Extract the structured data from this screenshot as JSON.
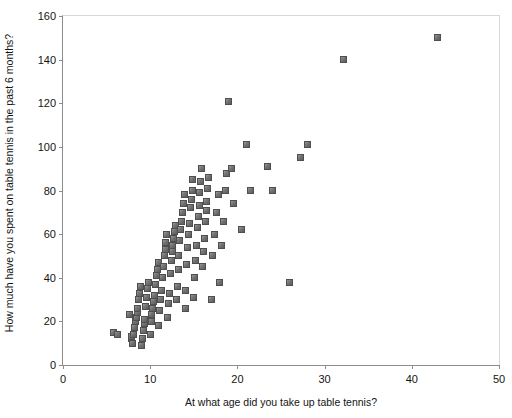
{
  "chart_data": {
    "type": "scatter",
    "title": "",
    "xlabel": "At what age did you take up table tennis?",
    "ylabel": "How much have you spent on table tennis in the past 6 months?",
    "xlim": [
      0,
      50
    ],
    "ylim": [
      0,
      160
    ],
    "xticks": [
      0,
      10,
      20,
      30,
      40,
      50
    ],
    "yticks": [
      0,
      20,
      40,
      60,
      80,
      100,
      120,
      140,
      160
    ],
    "grid": false,
    "legend": null,
    "marker": "square",
    "marker_color": "#6e6e6e",
    "axis_color": "#8c8c8c",
    "background_color": "#ffffff",
    "points": [
      [
        5.8,
        15
      ],
      [
        6.2,
        14
      ],
      [
        7.6,
        23
      ],
      [
        7.8,
        12
      ],
      [
        7.9,
        13
      ],
      [
        8.0,
        10
      ],
      [
        8.1,
        14
      ],
      [
        8.2,
        17
      ],
      [
        8.3,
        20
      ],
      [
        8.4,
        22
      ],
      [
        8.5,
        24
      ],
      [
        8.6,
        26
      ],
      [
        8.7,
        30
      ],
      [
        8.8,
        33
      ],
      [
        8.9,
        36
      ],
      [
        9.0,
        9
      ],
      [
        9.1,
        12
      ],
      [
        9.2,
        16
      ],
      [
        9.3,
        19
      ],
      [
        9.4,
        21
      ],
      [
        9.5,
        27
      ],
      [
        9.6,
        31
      ],
      [
        9.7,
        35
      ],
      [
        9.8,
        38
      ],
      [
        10.0,
        14
      ],
      [
        10.1,
        20
      ],
      [
        10.2,
        23
      ],
      [
        10.3,
        26
      ],
      [
        10.4,
        29
      ],
      [
        10.5,
        32
      ],
      [
        10.6,
        37
      ],
      [
        10.7,
        41
      ],
      [
        10.8,
        44
      ],
      [
        10.9,
        47
      ],
      [
        11.0,
        18
      ],
      [
        11.1,
        25
      ],
      [
        11.2,
        30
      ],
      [
        11.3,
        34
      ],
      [
        11.4,
        40
      ],
      [
        11.5,
        45
      ],
      [
        11.6,
        50
      ],
      [
        11.7,
        53
      ],
      [
        11.8,
        56
      ],
      [
        11.9,
        60
      ],
      [
        12.0,
        22
      ],
      [
        12.1,
        28
      ],
      [
        12.2,
        33
      ],
      [
        12.3,
        42
      ],
      [
        12.4,
        48
      ],
      [
        12.5,
        52
      ],
      [
        12.6,
        55
      ],
      [
        12.7,
        58
      ],
      [
        12.8,
        61
      ],
      [
        12.9,
        64
      ],
      [
        13.0,
        30
      ],
      [
        13.1,
        36
      ],
      [
        13.2,
        44
      ],
      [
        13.3,
        50
      ],
      [
        13.4,
        57
      ],
      [
        13.5,
        62
      ],
      [
        13.6,
        66
      ],
      [
        13.7,
        70
      ],
      [
        13.8,
        74
      ],
      [
        13.9,
        78
      ],
      [
        14.0,
        26
      ],
      [
        14.1,
        34
      ],
      [
        14.2,
        46
      ],
      [
        14.3,
        54
      ],
      [
        14.4,
        60
      ],
      [
        14.5,
        65
      ],
      [
        14.6,
        72
      ],
      [
        14.7,
        76
      ],
      [
        14.8,
        80
      ],
      [
        14.9,
        85
      ],
      [
        15.0,
        31
      ],
      [
        15.1,
        40
      ],
      [
        15.2,
        48
      ],
      [
        15.3,
        55
      ],
      [
        15.4,
        63
      ],
      [
        15.5,
        68
      ],
      [
        15.6,
        73
      ],
      [
        15.7,
        79
      ],
      [
        15.8,
        84
      ],
      [
        15.9,
        90
      ],
      [
        16.0,
        45
      ],
      [
        16.1,
        52
      ],
      [
        16.2,
        58
      ],
      [
        16.3,
        66
      ],
      [
        16.4,
        71
      ],
      [
        16.5,
        75
      ],
      [
        16.6,
        81
      ],
      [
        16.7,
        86
      ],
      [
        17.0,
        30
      ],
      [
        17.2,
        50
      ],
      [
        17.4,
        60
      ],
      [
        17.6,
        70
      ],
      [
        17.8,
        78
      ],
      [
        18.0,
        38
      ],
      [
        18.2,
        55
      ],
      [
        18.4,
        66
      ],
      [
        18.6,
        80
      ],
      [
        18.8,
        88
      ],
      [
        19.0,
        121
      ],
      [
        19.3,
        90
      ],
      [
        19.6,
        74
      ],
      [
        20.5,
        62
      ],
      [
        21.0,
        101
      ],
      [
        21.5,
        80
      ],
      [
        23.5,
        91
      ],
      [
        24.0,
        80
      ],
      [
        26.0,
        38
      ],
      [
        27.2,
        95
      ],
      [
        28.0,
        101
      ],
      [
        32.2,
        140
      ],
      [
        43.0,
        150
      ]
    ]
  }
}
